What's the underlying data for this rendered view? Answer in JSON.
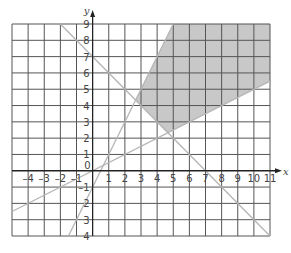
{
  "chart_data": {
    "type": "line",
    "title": "",
    "xlabel": "x",
    "ylabel": "y",
    "xlim": [
      -5,
      11
    ],
    "ylim": [
      -4,
      9
    ],
    "grid": true,
    "x_ticks": [
      -4,
      -3,
      -2,
      -1,
      1,
      2,
      3,
      4,
      5,
      6,
      7,
      8,
      9,
      10,
      11
    ],
    "x_tick_labels": [
      "–4",
      "–3",
      "–2",
      "–1",
      "1",
      "2",
      "3",
      "4",
      "5",
      "6",
      "7",
      "8",
      "9",
      "10",
      "11"
    ],
    "y_ticks": [
      9,
      8,
      7,
      6,
      5,
      4,
      3,
      2,
      1,
      -1,
      -2,
      -3,
      -4
    ],
    "y_tick_labels": [
      "9",
      "8",
      "7",
      "6",
      "5",
      "4",
      "3",
      "2",
      "1",
      "–1",
      "2",
      "3",
      "4"
    ],
    "origin_label": "0",
    "series": [
      {
        "name": "x + y = 7",
        "x": [
          -2,
          11
        ],
        "y": [
          9,
          -4
        ]
      },
      {
        "name": "y = 2x - 1",
        "x": [
          -1.5,
          5
        ],
        "y": [
          -4,
          9
        ]
      },
      {
        "name": "y = x/2",
        "x": [
          -5,
          11
        ],
        "y": [
          -2.5,
          5.5
        ]
      }
    ],
    "shaded_region": {
      "vertices": [
        [
          5,
          9
        ],
        [
          11,
          9
        ],
        [
          11,
          5.5
        ],
        [
          4.667,
          2.333
        ],
        [
          2.667,
          4.333
        ]
      ],
      "color": "#c8c8c8"
    },
    "line_color": "#b5b5b5",
    "grid_color": "#555555"
  }
}
